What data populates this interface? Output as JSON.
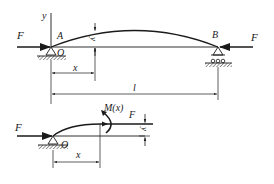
{
  "diagram": {
    "title": "",
    "colors": {
      "ink": "#1a1a1a",
      "hatch": "#333333",
      "background": "#ffffff"
    },
    "top_figure": {
      "force_left_label": "F",
      "force_right_label": "F",
      "axis_y_label": "y",
      "point_A_label": "A",
      "origin_label": "O",
      "point_B_label": "B",
      "deflection_label": "y",
      "dim_x_label": "x",
      "dim_l_label": "l",
      "supports": [
        "pin-support-A",
        "roller-support-B"
      ]
    },
    "bottom_figure": {
      "force_left_label": "F",
      "origin_label": "O",
      "moment_label": "M(x)",
      "force_right_label": "F",
      "deflection_label": "y",
      "dim_x_label": "x",
      "supports": [
        "pin-support-O"
      ]
    }
  }
}
